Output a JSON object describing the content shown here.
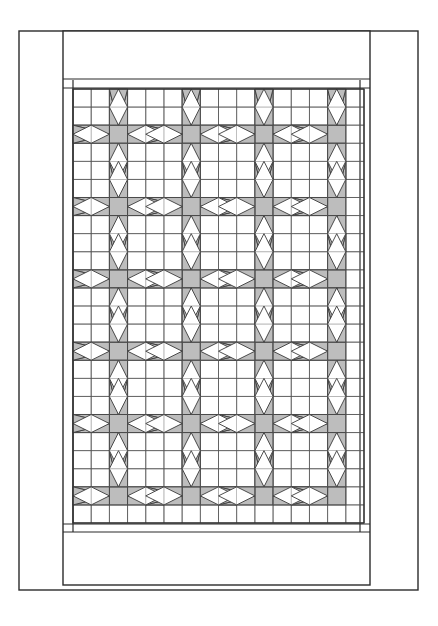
{
  "document": {
    "kind": "quilt-pattern-diagram",
    "title": "Quilt Pattern Diagram",
    "canvas": {
      "width": 438,
      "height": 626,
      "background": "#ffffff"
    }
  },
  "palette": {
    "background": "#ffffff",
    "patch_fill": "#bdbdbd",
    "patch_stroke": "#3a3a3a",
    "grid_line": "#555555",
    "frame_line": "#2b2b2b",
    "border_fill": "#ffffff"
  },
  "layout": {
    "outer_frame": {
      "x": 19,
      "y": 31,
      "width": 399,
      "height": 559,
      "stroke_width": 1.4,
      "label": "outer-page-frame"
    },
    "quilt_frame": {
      "x": 63,
      "y": 31,
      "width": 307,
      "height": 554,
      "stroke_width": 1.4,
      "label": "quilt-outer-border"
    },
    "top_border_band": {
      "x": 63,
      "y": 31,
      "width": 307,
      "height": 48,
      "label": "top-border-band"
    },
    "top_sashing_strip": {
      "x": 63,
      "y": 80,
      "width": 307,
      "height": 8,
      "label": "top-inner-sashing"
    },
    "bottom_sashing_strip": {
      "x": 63,
      "y": 524,
      "width": 307,
      "height": 8,
      "label": "bottom-inner-sashing"
    },
    "bottom_border_band": {
      "x": 63,
      "y": 533,
      "width": 307,
      "height": 52,
      "label": "bottom-border-band"
    },
    "left_border_strip": {
      "x": 63,
      "y": 31,
      "width": 10,
      "height": 554,
      "label": "left-border-strip"
    },
    "right_border_strip": {
      "x": 360,
      "y": 31,
      "width": 10,
      "height": 554,
      "label": "right-border-strip"
    },
    "quilt_body": {
      "x": 73,
      "y": 89,
      "width": 291,
      "height": 434,
      "label": "quilt-body-grid"
    }
  },
  "chart_data": {
    "type": "diagram",
    "grid": {
      "columns": 16,
      "rows": 24,
      "cell_width": 18.1875,
      "cell_height": 18.0833,
      "origin_x": 73,
      "origin_y": 89,
      "grid_visible": true
    },
    "block": {
      "name": "eight-point-star",
      "repeat_columns": 4,
      "repeat_rows": 6,
      "center_columns": [
        2,
        6,
        10,
        14
      ],
      "center_rows": [
        2,
        6,
        10,
        14,
        18,
        22
      ],
      "center_patch": "gray-square",
      "point_span_cells": 2,
      "void_shape": "white-diamond"
    },
    "counts": {
      "star_blocks": 24,
      "gray_center_squares": 24,
      "horizontal_point_pairs": 24,
      "vertical_point_pairs": 24
    },
    "xlabel": "",
    "ylabel": "",
    "legend": []
  }
}
